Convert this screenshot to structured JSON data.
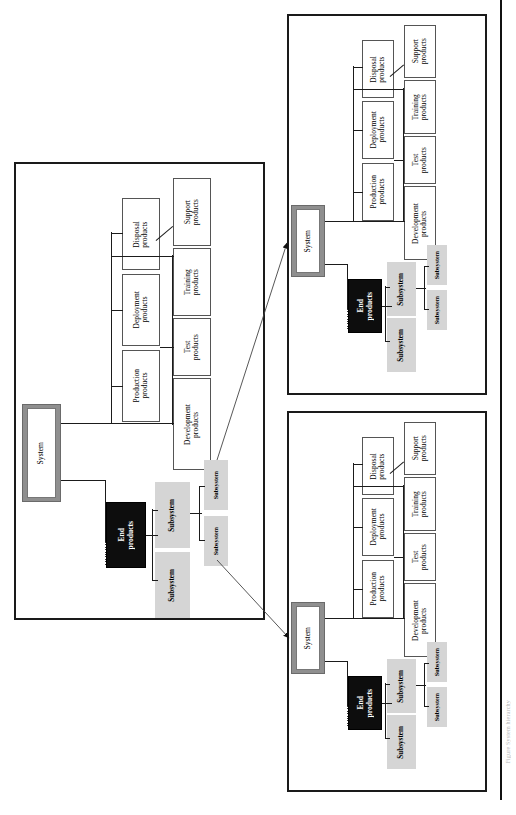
{
  "figure": {
    "orientation": "rotated-90-ccw",
    "caption": "Figure  System  hierarchy",
    "colors": {
      "system_frame": "#8f8f8f",
      "end_products_fill": "#0d0d0d",
      "subsystem_fill": "#d5d5d5",
      "product_fill": "#ffffff",
      "line": "#1b1b1b"
    }
  },
  "labels": {
    "system": "System",
    "end_products": "End\nproducts",
    "subsystem": "Subsystem",
    "development_products": "Development\nproducts",
    "test_products": "Test\nproducts",
    "training_products": "Training\nproducts",
    "support_products": "Support\nproducts",
    "production_products": "Production\nproducts",
    "deployment_products": "Deployment\nproducts",
    "disposal_products": "Disposal\nproducts"
  },
  "panels": [
    {
      "id": "main-panel",
      "name": "System level diagram",
      "root": "System",
      "branches": {
        "products": [
          "Development\nproducts",
          "Test\nproducts",
          "Training\nproducts",
          "Support\nproducts",
          "Production\nproducts",
          "Deployment\nproducts",
          "Disposal\nproducts"
        ],
        "end_products": "End\nproducts",
        "subsystems": [
          "Subsystem",
          "Subsystem",
          "Subsystem",
          "Subsystem"
        ]
      }
    },
    {
      "id": "subsystem-panel-top",
      "name": "Subsystem expansion (upper)",
      "root": "System",
      "branches": {
        "products": [
          "Development\nproducts",
          "Test\nproducts",
          "Training\nproducts",
          "Support\nproducts",
          "Production\nproducts",
          "Deployment\nproducts",
          "Disposal\nproducts"
        ],
        "end_products": "End\nproducts",
        "subsystems": [
          "Subsystem",
          "Subsystem",
          "Subsystem",
          "Subsystem"
        ]
      }
    },
    {
      "id": "subsystem-panel-bottom",
      "name": "Subsystem expansion (lower)",
      "root": "System",
      "branches": {
        "products": [
          "Development\nproducts",
          "Test\nproducts",
          "Training\nproducts",
          "Support\nproducts",
          "Production\nproducts",
          "Deployment\nproducts",
          "Disposal\nproducts"
        ],
        "end_products": "End\nproducts",
        "subsystems": [
          "Subsystem",
          "Subsystem",
          "Subsystem",
          "Subsystem"
        ]
      }
    }
  ],
  "arrows": [
    {
      "name": "subsystem-to-upper-panel",
      "from": "Subsystem (main panel)",
      "to": "System (upper panel)"
    },
    {
      "name": "subsystem-to-lower-panel",
      "from": "Subsystem (main panel)",
      "to": "System (lower panel)"
    }
  ]
}
